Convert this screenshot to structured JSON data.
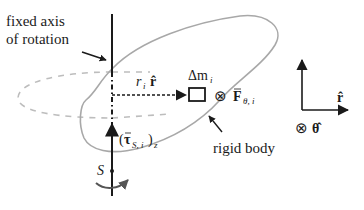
{
  "labels": {
    "axis_line1": "fixed axis",
    "axis_line2": "of rotation",
    "radius_r": "r",
    "radius_sub": "i",
    "radius_rhat": "r̂",
    "mass_delta": "Δm",
    "mass_sub": "i",
    "force_otimes": "⊗",
    "force_F": "F",
    "force_sub": "θ, i",
    "torque_open": "(",
    "torque_tau": "τ",
    "torque_sub": "S, i",
    "torque_close": ")",
    "torque_z": "z",
    "point_S": "S",
    "rigid_body": "rigid body",
    "basis_rhat": "r̂",
    "basis_otimes": "⊗",
    "basis_thetahat": "θ̂"
  },
  "colors": {
    "ink": "#1a1a1a",
    "body_outline": "#a8a8a8",
    "orbit_dashed": "#bdbdbd"
  },
  "icons": {
    "into_page": "otimes-icon",
    "rotation": "curved-arrow-icon"
  }
}
